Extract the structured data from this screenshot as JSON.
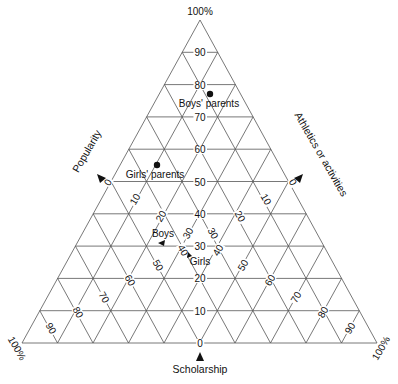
{
  "chart_data": {
    "type": "ternary",
    "title": "",
    "axes": [
      {
        "name": "Scholarship",
        "corner": "top",
        "corner_label": "100%",
        "ticks": [
          "0",
          "10",
          "20",
          "30",
          "40",
          "50",
          "60",
          "70",
          "80",
          "90"
        ]
      },
      {
        "name": "Popularity",
        "corner": "bottom-left",
        "corner_label": "100%",
        "ticks": [
          "0",
          "10",
          "20",
          "30",
          "40",
          "50",
          "60",
          "70",
          "80",
          "90"
        ]
      },
      {
        "name": "Athletics or activities",
        "corner": "bottom-right",
        "corner_label": "100%",
        "ticks": [
          "0",
          "10",
          "20",
          "30",
          "40",
          "50",
          "60",
          "70",
          "80",
          "90"
        ]
      }
    ],
    "grid": true,
    "grid_step": 10,
    "points": [
      {
        "label": "Boys' parents",
        "scholarship": 77,
        "popularity": 9,
        "athletics": 14,
        "marker": "dot"
      },
      {
        "label": "Girls' parents",
        "scholarship": 55,
        "popularity": 33,
        "athletics": 12,
        "marker": "dot"
      },
      {
        "label": "Boys",
        "scholarship": 31,
        "popularity": 45,
        "athletics": 24,
        "marker": "arrow"
      },
      {
        "label": "Girls",
        "scholarship": 29,
        "popularity": 36,
        "athletics": 35,
        "marker": "arrow"
      }
    ]
  },
  "labels": {
    "top_corner": "100%",
    "left_corner": "100%",
    "right_corner": "100%",
    "scholarship": "Scholarship",
    "popularity": "Popularity",
    "athletics": "Athletics or activities",
    "boys_parents": "Boys' parents",
    "girls_parents": "Girls' parents",
    "boys": "Boys",
    "girls": "Girls"
  },
  "scholarship_ticks": [
    "90",
    "80",
    "70",
    "60",
    "50",
    "40",
    "30",
    "20",
    "10",
    "0"
  ],
  "popularity_ticks": [
    "0",
    "10",
    "20",
    "30",
    "40",
    "50",
    "60",
    "70",
    "80",
    "90"
  ],
  "athletics_ticks": [
    "0",
    "10",
    "20",
    "30",
    "40",
    "50",
    "60",
    "70",
    "80",
    "90"
  ]
}
